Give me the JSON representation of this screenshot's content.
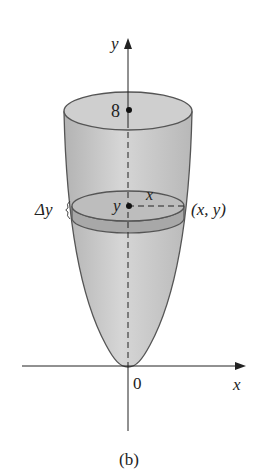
{
  "figure": {
    "caption": "(b)",
    "axes": {
      "y_label": "y",
      "x_label": "x",
      "origin_label": "0"
    },
    "top_marker_label": "8",
    "slice": {
      "thickness_label": "Δy",
      "height_label": "y",
      "radius_label": "x",
      "point_label": "(x, y)"
    },
    "colors": {
      "solid_fill": "#c4c4c4",
      "slice_fill": "#a9a9a9",
      "outline": "#555555",
      "axis": "#222222"
    }
  }
}
